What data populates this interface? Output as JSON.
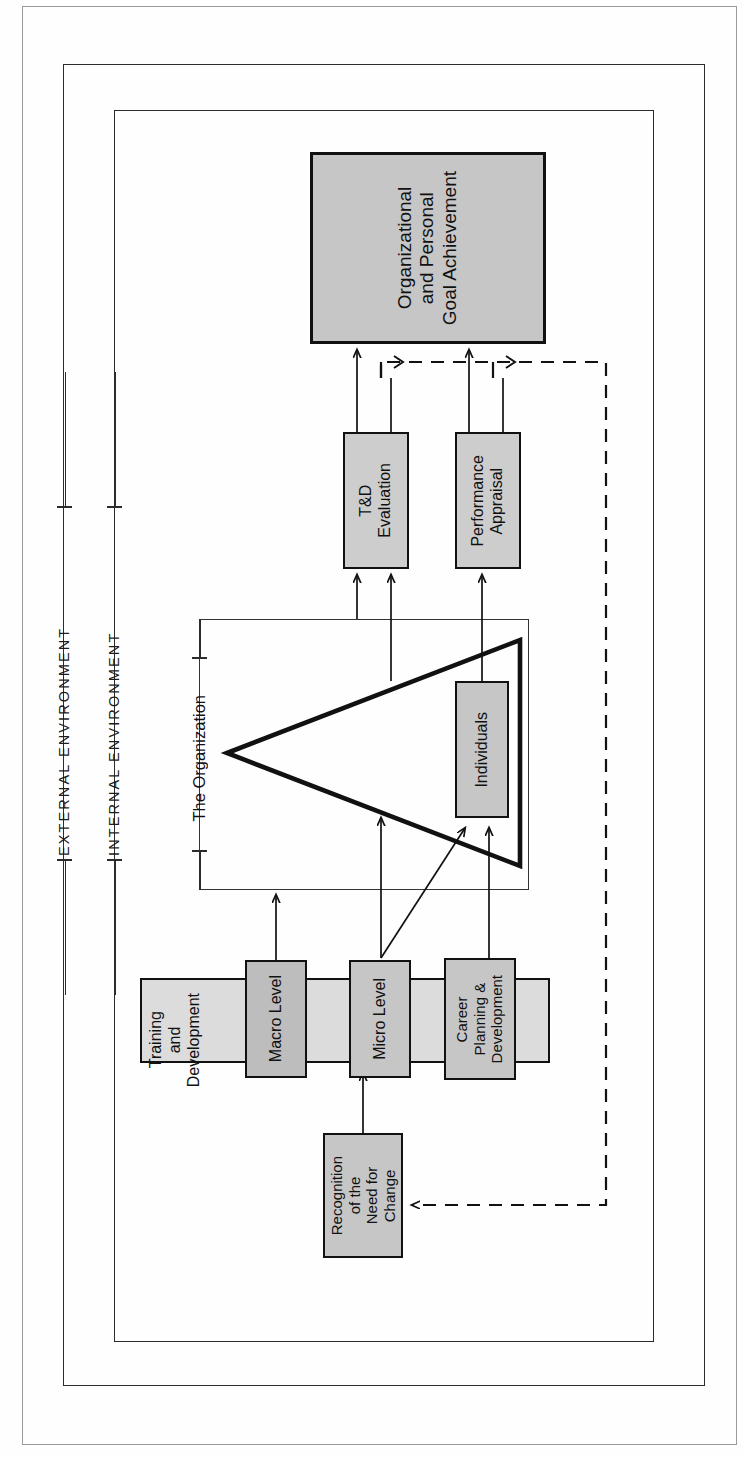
{
  "diagram": {
    "orientation": "rotated-90",
    "frames": [
      {
        "name": "outer-frame"
      },
      {
        "name": "external-environment-frame"
      },
      {
        "name": "internal-environment-frame"
      }
    ],
    "environment_labels": [
      {
        "id": "external",
        "text": "EXTERNAL ENVIRONMENT"
      },
      {
        "id": "internal",
        "text": "INTERNAL ENVIRONMENT"
      }
    ],
    "organization": {
      "label": "The Organization",
      "shape": "triangle-hierarchy"
    },
    "nodes": [
      {
        "id": "goal",
        "label": "Organizational\nand Personal\nGoal Achievement"
      },
      {
        "id": "td-eval",
        "label": "T&D\nEvaluation"
      },
      {
        "id": "perf-app",
        "label": "Performance\nAppraisal"
      },
      {
        "id": "individuals",
        "label": "Individuals"
      },
      {
        "id": "macro",
        "label": "Macro Level"
      },
      {
        "id": "micro",
        "label": "Micro Level"
      },
      {
        "id": "career",
        "label": "Career\nPlanning &\nDevelopment"
      },
      {
        "id": "recognition",
        "label": "Recognition\nof the\nNeed for\nChange"
      },
      {
        "id": "training",
        "label": "Training\nand\nDevelopment"
      }
    ],
    "colors": {
      "node_fill": "#c6c6c6",
      "container_fill": "#dcdcdc",
      "stroke": "#111111",
      "frame_stroke": "#2b2b2b",
      "page_background": "#fefefe"
    },
    "connectors": {
      "solid_count": 12,
      "dashed_feedback": "feedback loop from goal achievement back to recognition of the need for change"
    }
  }
}
